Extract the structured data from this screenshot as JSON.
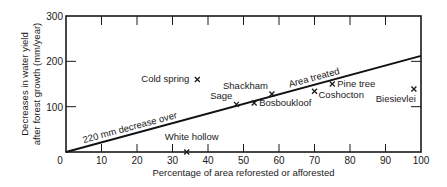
{
  "chart_data": {
    "type": "scatter",
    "title": "",
    "xlabel": "Percentage of area reforested or afforested",
    "ylabel_line1": "Decreases in water yield",
    "ylabel_line2": "after forest growth (mm/year)",
    "xlim": [
      0,
      100
    ],
    "ylim": [
      0,
      300
    ],
    "x_ticks": [
      0,
      10,
      20,
      30,
      40,
      50,
      60,
      70,
      80,
      90,
      100
    ],
    "y_ticks": [
      100,
      200,
      300
    ],
    "y_tick_labels": [
      "100",
      "200",
      "300"
    ],
    "origin_label": "0",
    "grid": false,
    "marker": "x",
    "points": [
      {
        "label": "Cold spring",
        "x": 37,
        "y": 160,
        "label_pos": "left"
      },
      {
        "label": "Sage",
        "x": 48,
        "y": 105,
        "label_pos": "left-above"
      },
      {
        "label": "Shackham",
        "x": 58,
        "y": 128,
        "label_pos": "left-above"
      },
      {
        "label": "Bosboukloof",
        "x": 53,
        "y": 108,
        "label_pos": "right"
      },
      {
        "label": "Pine tree",
        "x": 75,
        "y": 150,
        "label_pos": "right"
      },
      {
        "label": "Coshocton",
        "x": 70,
        "y": 134,
        "label_pos": "right-below"
      },
      {
        "label": "Biesievlei",
        "x": 98,
        "y": 139,
        "label_pos": "below-left"
      },
      {
        "label": "White hollow",
        "x": 34,
        "y": 0,
        "label_pos": "above"
      }
    ],
    "trend_line": {
      "from": [
        0,
        0
      ],
      "to": [
        100,
        212
      ],
      "annotation_lower": "220 mm decrease over",
      "annotation_upper": "Area treated"
    }
  }
}
